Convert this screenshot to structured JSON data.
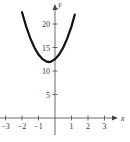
{
  "chart_data": {
    "type": "line",
    "title": "",
    "xlabel": "x",
    "ylabel": "y",
    "xlim": [
      -3.3,
      3.6
    ],
    "ylim": [
      -1,
      24
    ],
    "x_ticks": [
      -3,
      -2,
      -1,
      1,
      2,
      3
    ],
    "x_tick_labels": [
      "-3",
      "-2",
      "-1",
      "1",
      "2",
      "3"
    ],
    "y_ticks": [
      5,
      10,
      15,
      20
    ],
    "y_tick_labels": [
      "5",
      "10",
      "15",
      "20"
    ],
    "grid": false,
    "legend": null,
    "series": [
      {
        "name": "parabola",
        "color": "#111111",
        "x": [
          -2.0,
          -1.75,
          -1.5,
          -1.25,
          -1.0,
          -0.75,
          -0.5,
          -0.375,
          -0.25,
          0.0,
          0.25,
          0.5,
          0.75,
          1.0,
          1.2
        ],
        "y": [
          22.5,
          19.5,
          17.0,
          15.0,
          13.5,
          12.5,
          12.0,
          11.9,
          12.0,
          12.5,
          13.5,
          15.0,
          17.0,
          19.5,
          22.0
        ]
      }
    ]
  }
}
